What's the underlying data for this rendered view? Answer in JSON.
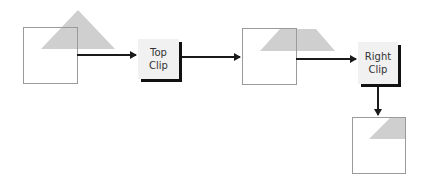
{
  "diagram": {
    "steps": [
      {
        "line1": "Top",
        "line2": "Clip"
      },
      {
        "line1": "Right",
        "line2": "Clip"
      }
    ],
    "colors": {
      "shape_fill": "#cfcfcf",
      "window_stroke": "#9a9a9a",
      "arrow": "#1a1a1a",
      "box_fill": "#f1f1f1",
      "box_shadow": "#111111",
      "text": "#333333"
    }
  }
}
